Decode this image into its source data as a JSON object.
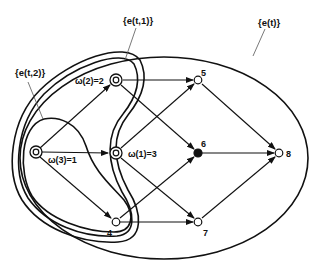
{
  "diagram": {
    "type": "directed-graph-with-nested-regions",
    "regions": [
      {
        "id": "e_t",
        "label": "{e(t)}"
      },
      {
        "id": "e_t1",
        "label": "{e(t,1)}"
      },
      {
        "id": "e_t2",
        "label": "{e(t,2)}"
      }
    ],
    "nodes": [
      {
        "id": "1",
        "label": "ω(3)=1",
        "style": "double-circle"
      },
      {
        "id": "2",
        "label": "ω(2)=2",
        "style": "double-circle"
      },
      {
        "id": "3",
        "label": "ω(1)=3",
        "style": "double-circle"
      },
      {
        "id": "4",
        "label": "4",
        "style": "open-circle"
      },
      {
        "id": "5",
        "label": "5",
        "style": "open-circle"
      },
      {
        "id": "6",
        "label": "6",
        "style": "filled-circle"
      },
      {
        "id": "7",
        "label": "7",
        "style": "open-circle"
      },
      {
        "id": "8",
        "label": "8",
        "style": "open-circle"
      }
    ],
    "edges": [
      {
        "from": "1",
        "to": "2"
      },
      {
        "from": "1",
        "to": "3"
      },
      {
        "from": "1",
        "to": "4"
      },
      {
        "from": "2",
        "to": "5"
      },
      {
        "from": "2",
        "to": "6"
      },
      {
        "from": "3",
        "to": "5"
      },
      {
        "from": "3",
        "to": "7"
      },
      {
        "from": "4",
        "to": "6"
      },
      {
        "from": "4",
        "to": "7"
      },
      {
        "from": "5",
        "to": "8"
      },
      {
        "from": "6",
        "to": "8"
      },
      {
        "from": "7",
        "to": "8"
      }
    ]
  }
}
